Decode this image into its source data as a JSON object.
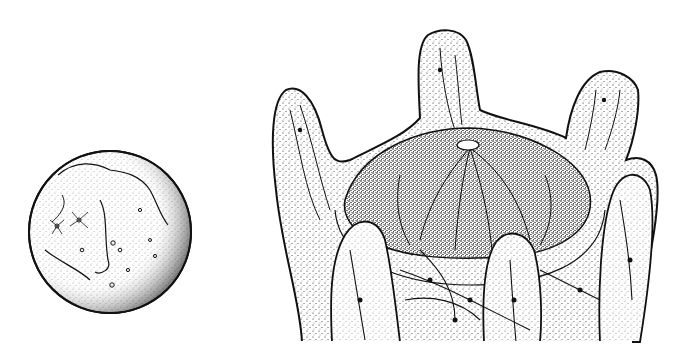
{
  "figure": {
    "panels": [
      {
        "id": "moon",
        "label": ""
      },
      {
        "id": "hand-structure",
        "label": ""
      }
    ],
    "colors": {
      "ink": "#111111",
      "paper": "#ffffff",
      "stipple": "#333333"
    }
  }
}
